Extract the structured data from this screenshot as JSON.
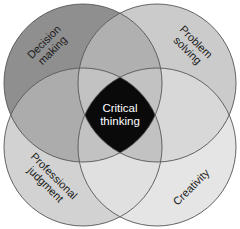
{
  "diagram": {
    "type": "four-circle venn",
    "center": {
      "line1": "Critical",
      "line2": "thinking",
      "color": "#0a0a0a"
    },
    "circles": [
      {
        "id": "decision",
        "line1": "Decision",
        "line2": "making",
        "color": "#8f8f8f"
      },
      {
        "id": "problem",
        "line1": "Problem",
        "line2": "solving",
        "color": "#cbcbcb"
      },
      {
        "id": "professional",
        "line1": "Professional",
        "line2": "judgment",
        "color": "#d2d2d2"
      },
      {
        "id": "creativity",
        "line1": "Creativity",
        "line2": "",
        "color": "#e5e5e5"
      }
    ],
    "overlap_colors": {
      "top": "#b0b0b0",
      "left": "#acacac",
      "right": "#d8d8d8",
      "bottom": "#e0e0e0",
      "triple": "#c2c2c2"
    },
    "stroke_color": "#555555"
  }
}
